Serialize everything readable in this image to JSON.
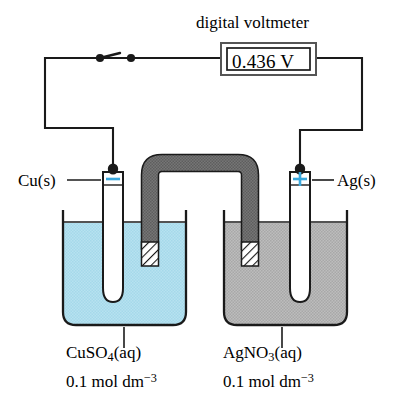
{
  "figure": {
    "type": "electrochemical-cell-diagram"
  },
  "meter": {
    "title": "digital voltmeter",
    "reading": "0.436 V",
    "value": 0.436,
    "unit": "V"
  },
  "electrodes": {
    "left": {
      "label": "Cu(s)",
      "polarity": "-",
      "polarity_name": "negative-terminal"
    },
    "right": {
      "label": "Ag(s)",
      "polarity": "+",
      "polarity_name": "positive-terminal"
    }
  },
  "solutions": {
    "left": {
      "formula_main": "CuSO",
      "formula_sub": "4",
      "formula_state": "(aq)",
      "full_name": "CuSO4(aq)",
      "concentration_value": "0.1 mol dm",
      "concentration_exp": "−3",
      "concentration_full": "0.1 mol dm-3"
    },
    "right": {
      "formula_main": "AgNO",
      "formula_sub": "3",
      "formula_state": "(aq)",
      "full_name": "AgNO3(aq)",
      "concentration_value": "0.1 mol dm",
      "concentration_exp": "−3",
      "concentration_full": "0.1 mol dm-3"
    }
  },
  "components": {
    "switch": "closed-switch",
    "salt_bridge": "salt-bridge",
    "wire": "connecting-wire"
  },
  "colors": {
    "copper_solution": "#b3e0ef",
    "silver_solution": "#b8b8b8",
    "salt_bridge": "#6e6e6e",
    "polarity_sign": "#3aa8dd",
    "outline": "#1a1a1a",
    "background": "#ffffff"
  }
}
